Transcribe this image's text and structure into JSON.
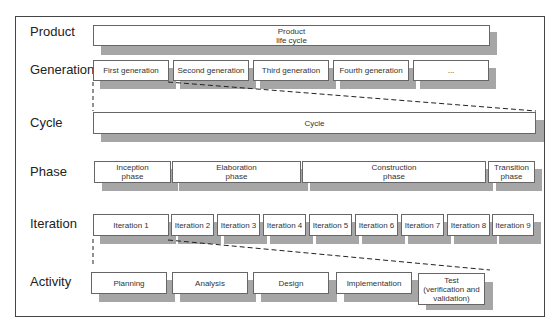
{
  "levels": [
    {
      "label": "Product"
    },
    {
      "label": "Generation"
    },
    {
      "label": "Cycle"
    },
    {
      "label": "Phase"
    },
    {
      "label": "Iteration"
    },
    {
      "label": "Activity"
    }
  ],
  "product": {
    "box": "Product\nlife cycle"
  },
  "generations": [
    "First generation",
    "Second generation",
    "Third generation",
    "Fourth generation",
    "..."
  ],
  "cycle": {
    "box": "Cycle"
  },
  "phases": [
    "Inception\nphase",
    "Elaboration\nphase",
    "Construction\nphase",
    "Transition\nphase"
  ],
  "iterations": [
    "Iteration 1",
    "Iteration 2",
    "Iteration 3",
    "Iteration 4",
    "Iteration 5",
    "Iteration 6",
    "Iteration 7",
    "Iteration 8",
    "Iteration 9"
  ],
  "activities": [
    "Planning",
    "Analysis",
    "Design",
    "Implementation",
    "Test\n(verification and\nvalidation)"
  ],
  "colors": {
    "shadow": "#a6a6a6",
    "border": "#666666",
    "frame": "#444444"
  }
}
